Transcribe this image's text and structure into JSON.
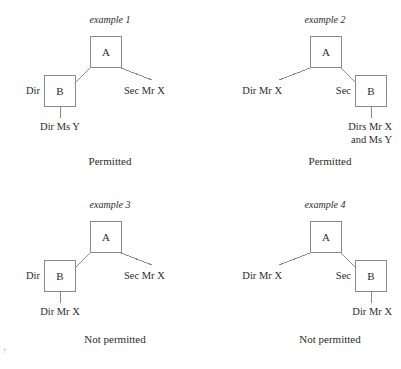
{
  "figure": {
    "line_color": "#8a8a8a",
    "text_color": "#2b2b2b",
    "background": "#ffffff"
  },
  "examples": [
    {
      "id": "example-1",
      "label": "example 1",
      "caption": "Permitted",
      "orientation": "left",
      "nodes": {
        "parent": "A",
        "child": "B"
      },
      "labels": {
        "branch_role": "Dir",
        "other_branch": "Sec Mr X",
        "child_officer": "Dir Ms Y"
      }
    },
    {
      "id": "example-2",
      "label": "example 2",
      "caption": "Permitted",
      "orientation": "right",
      "nodes": {
        "parent": "A",
        "child": "B"
      },
      "labels": {
        "branch_role": "Sec",
        "other_branch": "Dir Mr X",
        "child_officer_line1": "Dirs Mr X",
        "child_officer_line2": "and Ms Y"
      }
    },
    {
      "id": "example-3",
      "label": "example 3",
      "caption": "Not permitted",
      "orientation": "left",
      "nodes": {
        "parent": "A",
        "child": "B"
      },
      "labels": {
        "branch_role": "Dir",
        "other_branch": "Sec Mr X",
        "child_officer": "Dir Mr X"
      }
    },
    {
      "id": "example-4",
      "label": "example 4",
      "caption": "Not permitted",
      "orientation": "right",
      "nodes": {
        "parent": "A",
        "child": "B"
      },
      "labels": {
        "branch_role": "Sec",
        "other_branch": "Dir Mr X",
        "child_officer": "Dir Mr X"
      }
    }
  ]
}
